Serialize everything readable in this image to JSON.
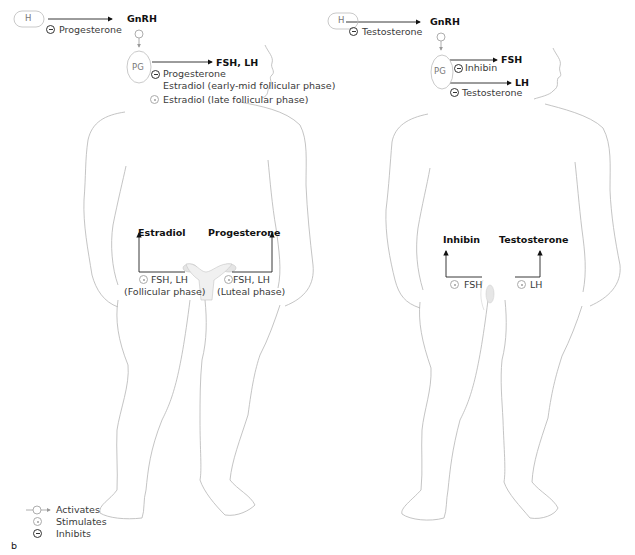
{
  "panel_label": "b",
  "female": {
    "hypothalamus": "H",
    "pituitary": "PG",
    "gnrh": "GnRH",
    "h_inhibitor": "Progesterone",
    "pg_output": "FSH, LH",
    "pg_inhibitors": [
      "Progesterone",
      "Estradiol (early-mid follicular phase)"
    ],
    "pg_stimulator": "Estradiol (late follicular phase)",
    "gonad_left_output": "Estradiol",
    "gonad_right_output": "Progesterone",
    "gonad_left_stimulus": "FSH, LH",
    "gonad_left_phase": "(Follicular phase)",
    "gonad_right_stimulus": "FSH, LH",
    "gonad_right_phase": "(Luteal phase)"
  },
  "male": {
    "hypothalamus": "H",
    "pituitary": "PG",
    "gnrh": "GnRH",
    "h_inhibitor": "Testosterone",
    "pg_output_1": "FSH",
    "pg_inhibitor_1": "Inhibin",
    "pg_output_2": "LH",
    "pg_inhibitor_2": "Testosterone",
    "gonad_left_output": "Inhibin",
    "gonad_right_output": "Testosterone",
    "gonad_left_stimulus": "FSH",
    "gonad_right_stimulus": "LH"
  },
  "legend": {
    "items": [
      {
        "icon": "activates-arrow-icon",
        "label": "Activates"
      },
      {
        "icon": "stimulates-circle-icon",
        "label": "Stimulates"
      },
      {
        "icon": "inhibits-minus-icon",
        "label": "Inhibits"
      }
    ]
  },
  "colors": {
    "outline": "#b0b0b0",
    "arrow": "#1a1a1a",
    "text": "#3a3a3a"
  }
}
